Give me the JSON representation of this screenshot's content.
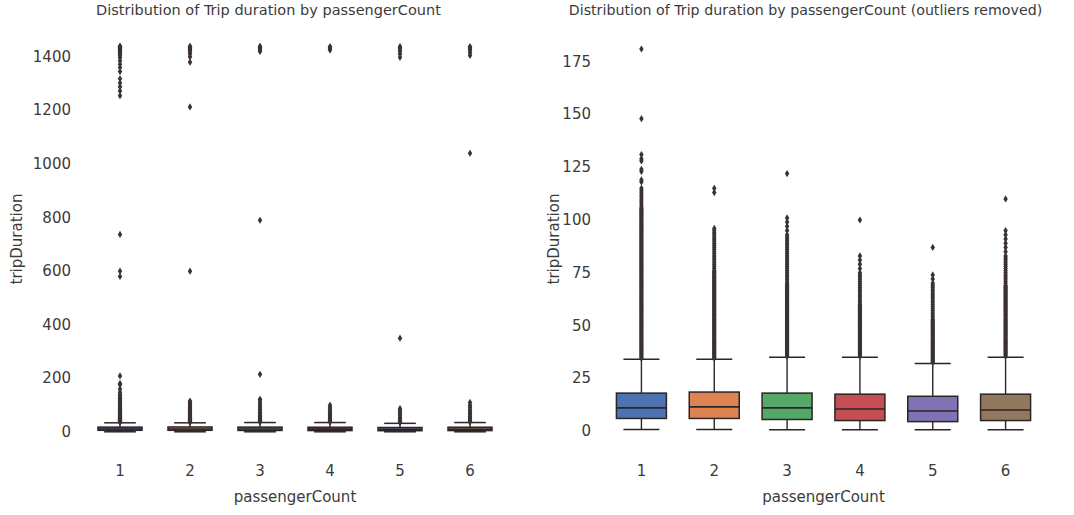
{
  "figure": {
    "background": "#ffffff",
    "text_color": "#3b3b3b",
    "marker_color": "#3a3233",
    "line_color": "#2b2527"
  },
  "panels": [
    {
      "id": "left",
      "title": "Distribution of Trip duration by passengerCount",
      "xlabel": "passengerCount",
      "ylabel": "tripDuration"
    },
    {
      "id": "right",
      "title": "Distribution of Trip duration by passengerCount (outliers removed)",
      "xlabel": "passengerCount",
      "ylabel": "tripDuration"
    }
  ],
  "chart_data": [
    {
      "type": "box",
      "id": "left",
      "title": "Distribution of Trip duration by passengerCount",
      "xlabel": "passengerCount",
      "ylabel": "tripDuration",
      "categories": [
        "1",
        "2",
        "3",
        "4",
        "5",
        "6"
      ],
      "xticklabels": [
        "1",
        "2",
        "3",
        "4",
        "5",
        "6"
      ],
      "yticks": [
        0,
        200,
        400,
        600,
        800,
        1000,
        1200,
        1400
      ],
      "yticklabels": [
        "0",
        "200",
        "400",
        "600",
        "800",
        "1000",
        "1200",
        "1400"
      ],
      "ylim": [
        -60,
        1500
      ],
      "grid": false,
      "legend": false,
      "palette": [
        "#4c72b0",
        "#dd8452",
        "#55a868",
        "#c44e52",
        "#8172b3",
        "#937860"
      ],
      "boxes": [
        {
          "category": "1",
          "q1": 6.0,
          "median": 11.0,
          "q3": 18.0,
          "whisker_low": 0.5,
          "whisker_high": 34.0,
          "outliers": [
            36,
            38,
            39,
            41,
            42,
            44,
            45,
            47,
            48,
            50,
            52,
            54,
            56,
            58,
            60,
            62,
            65,
            68,
            70,
            73,
            76,
            80,
            84,
            88,
            92,
            96,
            100,
            104,
            108,
            112,
            116,
            120,
            125,
            130,
            135,
            140,
            148,
            160,
            176,
            181,
            209,
            580,
            600,
            737,
            1255,
            1272,
            1288,
            1302,
            1318,
            1345,
            1360,
            1372,
            1385,
            1396,
            1404,
            1410,
            1415,
            1419,
            1423,
            1426,
            1429,
            1432,
            1434,
            1436,
            1437,
            1438,
            1439
          ]
        },
        {
          "category": "2",
          "q1": 6.0,
          "median": 11.0,
          "q3": 18.5,
          "whisker_low": 0.5,
          "whisker_high": 34.0,
          "outliers": [
            36,
            38,
            40,
            42,
            44,
            46,
            48,
            50,
            53,
            56,
            59,
            62,
            66,
            70,
            74,
            78,
            82,
            86,
            90,
            95,
            100,
            105,
            110,
            115,
            600,
            1213,
            1380,
            1400,
            1410,
            1418,
            1424,
            1428,
            1432,
            1435,
            1437,
            1439
          ]
        },
        {
          "category": "3",
          "q1": 5.5,
          "median": 11.0,
          "q3": 18.0,
          "whisker_low": 0.5,
          "whisker_high": 35.0,
          "outliers": [
            37,
            39,
            41,
            44,
            47,
            50,
            54,
            58,
            62,
            67,
            72,
            78,
            84,
            90,
            97,
            104,
            112,
            120,
            122,
            215,
            790,
            1420,
            1426,
            1430,
            1434,
            1437,
            1439
          ]
        },
        {
          "category": "4",
          "q1": 5.0,
          "median": 10.5,
          "q3": 17.5,
          "whisker_low": 0.5,
          "whisker_high": 35.0,
          "outliers": [
            37,
            40,
            43,
            47,
            51,
            55,
            60,
            66,
            72,
            78,
            85,
            92,
            100,
            1425,
            1430,
            1435,
            1438
          ]
        },
        {
          "category": "5",
          "q1": 4.5,
          "median": 9.5,
          "q3": 16.5,
          "whisker_low": 0.5,
          "whisker_high": 32.0,
          "outliers": [
            35,
            38,
            41,
            45,
            49,
            54,
            60,
            66,
            73,
            80,
            87,
            350,
            1398,
            1410,
            1420,
            1428,
            1434,
            1438
          ]
        },
        {
          "category": "6",
          "q1": 5.0,
          "median": 10.0,
          "q3": 17.5,
          "whisker_low": 0.5,
          "whisker_high": 35.0,
          "outliers": [
            37,
            40,
            44,
            48,
            53,
            58,
            64,
            70,
            77,
            84,
            92,
            100,
            110,
            1040,
            1405,
            1415,
            1424,
            1430,
            1435,
            1438
          ]
        }
      ]
    },
    {
      "type": "box",
      "id": "right",
      "title": "Distribution of Trip duration by passengerCount (outliers removed)",
      "xlabel": "passengerCount",
      "ylabel": "tripDuration",
      "categories": [
        "1",
        "2",
        "3",
        "4",
        "5",
        "6"
      ],
      "xticklabels": [
        "1",
        "2",
        "3",
        "4",
        "5",
        "6"
      ],
      "yticks": [
        0,
        25,
        50,
        75,
        100,
        125,
        150,
        175
      ],
      "yticklabels": [
        "0",
        "25",
        "50",
        "75",
        "100",
        "125",
        "150",
        "175"
      ],
      "ylim": [
        -8,
        190
      ],
      "grid": false,
      "legend": false,
      "palette": [
        "#4c72b0",
        "#dd8452",
        "#55a868",
        "#c44e52",
        "#8172b3",
        "#937860"
      ],
      "boxes": [
        {
          "category": "1",
          "q1": 6.0,
          "median": 11.0,
          "q3": 18.0,
          "whisker_low": 0.8,
          "whisker_high": 34.0,
          "outliers": [
            34.5,
            35,
            35.5,
            36,
            36.5,
            37,
            37.5,
            38,
            38.5,
            39,
            39.5,
            40,
            40.5,
            41,
            41.5,
            42,
            42.5,
            43,
            43.5,
            44,
            44.5,
            45,
            45.5,
            46,
            46.5,
            47,
            47.5,
            48,
            48.5,
            49,
            49.5,
            50,
            50.5,
            51,
            51.5,
            52,
            52.5,
            53,
            53.5,
            54,
            54.5,
            55,
            55.5,
            56,
            56.5,
            57,
            57.5,
            58,
            58.5,
            59,
            59.5,
            60,
            60.5,
            61,
            61.5,
            62,
            62.5,
            63,
            63.5,
            64,
            64.5,
            65,
            65.5,
            66,
            66.5,
            67,
            67.5,
            68,
            68.5,
            69,
            69.5,
            70,
            70.5,
            71,
            71.5,
            72,
            72.5,
            73,
            73.5,
            74,
            74.5,
            75,
            75.5,
            76,
            76.5,
            77,
            77.5,
            78,
            78.5,
            79,
            79.5,
            80,
            80.5,
            81,
            81.5,
            82,
            82.5,
            83,
            83.5,
            84,
            84.5,
            85,
            85.5,
            86,
            86.5,
            87,
            87.5,
            88,
            88.5,
            89,
            89.5,
            90,
            90.5,
            91,
            91.5,
            92,
            92.5,
            93,
            93.5,
            94,
            94.5,
            95,
            95.5,
            96,
            96.5,
            97,
            97.5,
            98,
            98.5,
            99,
            99.5,
            100,
            100.5,
            101,
            101.5,
            102,
            102.5,
            103,
            103.5,
            104,
            104.5,
            105,
            105.5,
            106,
            107,
            108,
            109,
            110,
            111,
            112,
            113,
            114,
            115,
            118,
            119,
            123,
            124,
            128,
            129,
            131,
            148,
            181
          ]
        },
        {
          "category": "2",
          "q1": 6.0,
          "median": 11.5,
          "q3": 18.5,
          "whisker_low": 0.8,
          "whisker_high": 34.0,
          "outliers": [
            34.5,
            35,
            35.5,
            36,
            36.5,
            37,
            37.5,
            38,
            38.5,
            39,
            39.5,
            40,
            40.5,
            41,
            41.5,
            42,
            42.5,
            43,
            43.5,
            44,
            44.5,
            45,
            45.5,
            46,
            46.5,
            47,
            47.5,
            48,
            48.5,
            49,
            49.5,
            50,
            50.5,
            51,
            51.5,
            52,
            52.5,
            53,
            53.5,
            54,
            54.5,
            55,
            55.5,
            56,
            56.5,
            57,
            57.5,
            58,
            58.5,
            59,
            59.5,
            60,
            60.5,
            61,
            61.5,
            62,
            62.5,
            63,
            63.5,
            64,
            64.5,
            65,
            65.5,
            66,
            66.5,
            67,
            67.5,
            68,
            68.5,
            69,
            69.5,
            70,
            70.5,
            71,
            71.5,
            72,
            72.5,
            73,
            73.5,
            74,
            74.5,
            75,
            75.5,
            76,
            77,
            78,
            79,
            80,
            81,
            82,
            83,
            84,
            85,
            86,
            87,
            88,
            89,
            90,
            91,
            92,
            93,
            94,
            95,
            96,
            113,
            115
          ]
        },
        {
          "category": "3",
          "q1": 5.5,
          "median": 11.0,
          "q3": 18.0,
          "whisker_low": 0.6,
          "whisker_high": 35.0,
          "outliers": [
            35.5,
            36,
            36.5,
            37,
            37.5,
            38,
            38.5,
            39,
            39.5,
            40,
            40.5,
            41,
            41.5,
            42,
            42.5,
            43,
            43.5,
            44,
            44.5,
            45,
            45.5,
            46,
            46.5,
            47,
            47.5,
            48,
            48.5,
            49,
            49.5,
            50,
            50.5,
            51,
            51.5,
            52,
            52.5,
            53,
            53.5,
            54,
            54.5,
            55,
            55.5,
            56,
            56.5,
            57,
            57.5,
            58,
            58.5,
            59,
            59.5,
            60,
            60.5,
            61,
            61.5,
            62,
            62.5,
            63,
            63.5,
            64,
            64.5,
            65,
            65.5,
            66,
            66.5,
            67,
            67.5,
            68,
            68.5,
            69,
            69.5,
            70,
            71,
            72,
            73,
            74,
            75,
            76,
            77,
            78,
            79,
            80,
            81,
            82,
            83,
            84,
            85,
            86,
            87,
            88,
            89,
            90,
            91,
            92,
            93,
            95,
            97,
            99,
            101,
            122
          ]
        },
        {
          "category": "4",
          "q1": 5.0,
          "median": 10.5,
          "q3": 17.5,
          "whisker_low": 0.6,
          "whisker_high": 35.0,
          "outliers": [
            35.5,
            36,
            36.5,
            37,
            37.5,
            38,
            38.5,
            39,
            39.5,
            40,
            40.5,
            41,
            41.5,
            42,
            42.5,
            43,
            43.5,
            44,
            44.5,
            45,
            45.5,
            46,
            46.5,
            47,
            47.5,
            48,
            48.5,
            49,
            49.5,
            50,
            50.5,
            51,
            51.5,
            52,
            52.5,
            53,
            53.5,
            54,
            54.5,
            55,
            55.5,
            56,
            56.5,
            57,
            57.5,
            58,
            58.5,
            59,
            59.5,
            60,
            61,
            62,
            63,
            64,
            65,
            66,
            67,
            68,
            69,
            70,
            71,
            72,
            73,
            74,
            75,
            77,
            79,
            81,
            83,
            100
          ]
        },
        {
          "category": "5",
          "q1": 4.5,
          "median": 9.5,
          "q3": 16.5,
          "whisker_low": 0.6,
          "whisker_high": 32.0,
          "outliers": [
            32.5,
            33,
            33.5,
            34,
            34.5,
            35,
            35.5,
            36,
            36.5,
            37,
            37.5,
            38,
            38.5,
            39,
            39.5,
            40,
            40.5,
            41,
            41.5,
            42,
            42.5,
            43,
            43.5,
            44,
            44.5,
            45,
            45.5,
            46,
            46.5,
            47,
            47.5,
            48,
            48.5,
            49,
            49.5,
            50,
            50.5,
            51,
            51.5,
            52,
            52.5,
            53,
            54,
            55,
            56,
            57,
            58,
            59,
            60,
            61,
            62,
            63,
            64,
            65,
            66,
            67,
            68,
            69,
            70,
            72,
            74,
            87
          ]
        },
        {
          "category": "6",
          "q1": 5.0,
          "median": 10.0,
          "q3": 17.5,
          "whisker_low": 0.6,
          "whisker_high": 35.0,
          "outliers": [
            35.5,
            36,
            36.5,
            37,
            37.5,
            38,
            38.5,
            39,
            39.5,
            40,
            40.5,
            41,
            41.5,
            42,
            42.5,
            43,
            43.5,
            44,
            44.5,
            45,
            45.5,
            46,
            46.5,
            47,
            47.5,
            48,
            48.5,
            49,
            49.5,
            50,
            50.5,
            51,
            51.5,
            52,
            52.5,
            53,
            53.5,
            54,
            54.5,
            55,
            55.5,
            56,
            56.5,
            57,
            57.5,
            58,
            58.5,
            59,
            59.5,
            60,
            60.5,
            61,
            61.5,
            62,
            62.5,
            63,
            63.5,
            64,
            64.5,
            65,
            65.5,
            66,
            66.5,
            67,
            67.5,
            68,
            68.5,
            69,
            70,
            71,
            72,
            73,
            74,
            75,
            76,
            77,
            78,
            79,
            80,
            81,
            82,
            83,
            85,
            87,
            89,
            91,
            93,
            95,
            110
          ]
        }
      ]
    }
  ]
}
